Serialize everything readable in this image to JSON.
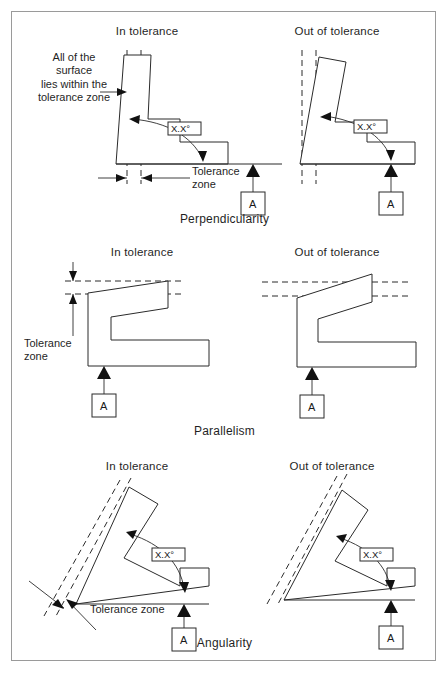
{
  "figure": {
    "column_headers": {
      "left": "In tolerance",
      "right": "Out of tolerance"
    },
    "datum_letter": "A",
    "angle_callout": "X.X°",
    "colors": {
      "line": "#2b2b2b",
      "border": "#9a9a9a",
      "background": "#ffffff",
      "fill_black": "#111111"
    }
  },
  "sections": [
    {
      "id": "perpendicularity",
      "caption": "Perpendicularity",
      "note": "All of the\nsurface\nlies within the\ntolerance zone",
      "zone_label": "Tolerance\nzone",
      "left_header": "In tolerance",
      "right_header": "Out of tolerance",
      "angle_callout": "X.X°",
      "datum_letter": "A"
    },
    {
      "id": "parallelism",
      "caption": "Parallelism",
      "zone_label": "Tolerance\nzone",
      "left_header": "In tolerance",
      "right_header": "Out of tolerance",
      "datum_letter": "A"
    },
    {
      "id": "angularity",
      "caption": "Angularity",
      "zone_label": "Tolerance zone",
      "left_header": "In tolerance",
      "right_header": "Out of tolerance",
      "angle_callout": "X.X°",
      "datum_letter": "A"
    }
  ]
}
